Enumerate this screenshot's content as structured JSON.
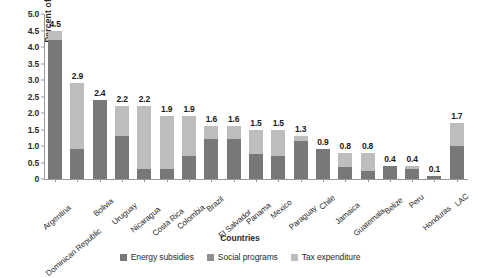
{
  "chart_data": {
    "type": "bar",
    "subtype": "stacked-bar",
    "title": "",
    "xlabel": "Countries",
    "ylabel": "Percent of GDP",
    "ylim": [
      0,
      5.0
    ],
    "yticks": [
      "0",
      "0.5",
      "1.0",
      "1.5",
      "2.0",
      "2.5",
      "3.0",
      "3.5",
      "4.0",
      "4.5",
      "5.0"
    ],
    "ytick_values": [
      0,
      0.5,
      1.0,
      1.5,
      2.0,
      2.5,
      3.0,
      3.5,
      4.0,
      4.5,
      5.0
    ],
    "grid": false,
    "legend_position": "bottom",
    "categories": [
      "Argentina",
      "Dominican Republic",
      "Bolivia",
      "Uruguay",
      "Nicaragua",
      "Costa Rica",
      "Colombia",
      "Brazil",
      "El Salvador",
      "Panama",
      "Mexico",
      "Paraguay",
      "Chile",
      "Jamaica",
      "Guatemala",
      "Belize",
      "Peru",
      "Honduras",
      "LAC"
    ],
    "series": [
      {
        "name": "Energy subsidies",
        "color": "#787878",
        "values": [
          4.2,
          0.9,
          2.4,
          1.3,
          0.3,
          0.3,
          0.7,
          1.2,
          1.2,
          0.75,
          0.7,
          1.15,
          0.9,
          0.35,
          0.25,
          0.4,
          0.3,
          0.1,
          1.0
        ]
      },
      {
        "name": "Social programs",
        "color": "#8f8f8f",
        "values": [
          0.0,
          0.0,
          0.0,
          0.0,
          0.0,
          0.0,
          0.0,
          0.0,
          0.0,
          0.0,
          0.0,
          0.0,
          0.0,
          0.0,
          0.0,
          0.0,
          0.0,
          0.0,
          0.0
        ]
      },
      {
        "name": "Tax expenditure",
        "color": "#bdbdbd",
        "values": [
          0.3,
          2.0,
          0.0,
          0.9,
          1.9,
          1.6,
          1.2,
          0.4,
          0.4,
          0.75,
          0.8,
          0.15,
          0.0,
          0.45,
          0.55,
          0.0,
          0.1,
          0.0,
          0.7
        ]
      }
    ],
    "totals": [
      4.5,
      2.9,
      2.4,
      2.2,
      2.2,
      1.9,
      1.9,
      1.6,
      1.6,
      1.5,
      1.5,
      1.3,
      0.9,
      0.8,
      0.8,
      0.4,
      0.4,
      0.1,
      1.7
    ],
    "data_labels": [
      "4.5",
      "2.9",
      "2.4",
      "2.2",
      "2.2",
      "1.9",
      "1.9",
      "1.6",
      "1.6",
      "1.5",
      "1.5",
      "1.3",
      "0.9",
      "0.8",
      "0.8",
      "0.4",
      "0.4",
      "0.1",
      "1.7"
    ]
  },
  "legend": {
    "items": [
      {
        "label": "Energy subsidies",
        "color": "#787878"
      },
      {
        "label": "Social programs",
        "color": "#8f8f8f"
      },
      {
        "label": "Tax expenditure",
        "color": "#bdbdbd"
      }
    ]
  },
  "axes": {
    "y_title": "Percent of GDP",
    "x_title": "Countries"
  }
}
